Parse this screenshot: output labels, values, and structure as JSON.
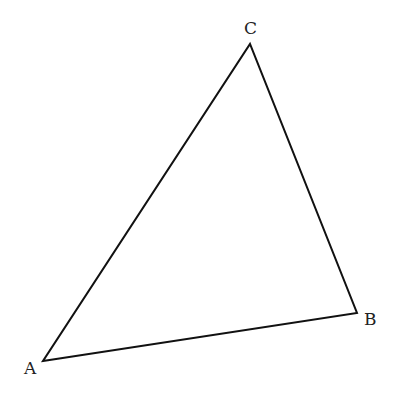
{
  "diagram": {
    "type": "triangle",
    "stroke_color": "#111111",
    "vertices": [
      {
        "label": "A",
        "x": 43,
        "y": 361,
        "label_x": 24,
        "label_y": 374
      },
      {
        "label": "B",
        "x": 357,
        "y": 313,
        "label_x": 364,
        "label_y": 325
      },
      {
        "label": "C",
        "x": 250,
        "y": 44,
        "label_x": 244,
        "label_y": 34
      }
    ]
  }
}
